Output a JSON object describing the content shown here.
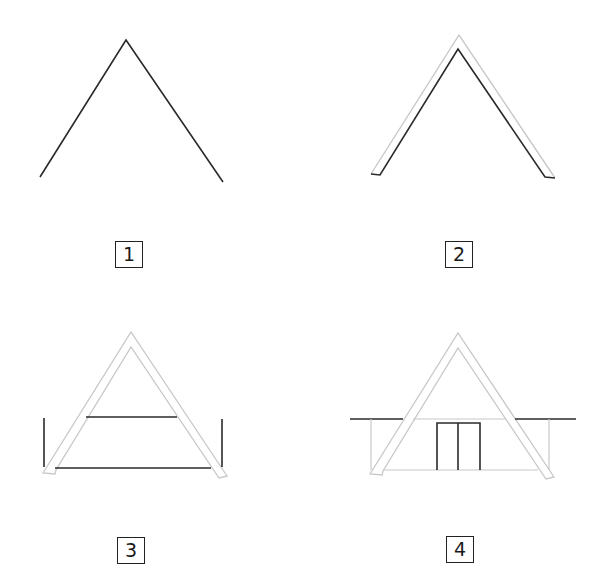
{
  "diagram": {
    "title": "",
    "colors": {
      "ink": "#2a2a2a",
      "faint": "#c8c8c8",
      "background": "#ffffff"
    },
    "steps": [
      {
        "number": "1",
        "content": "Inverted V line (roof outline)"
      },
      {
        "number": "2",
        "content": "Double-line roof with thickness (A-frame beams)"
      },
      {
        "number": "3",
        "content": "Beams added: crossbar, floor line and two vertical posts"
      },
      {
        "number": "4",
        "content": "Horizontal eaves line, side walls and double door"
      }
    ]
  }
}
